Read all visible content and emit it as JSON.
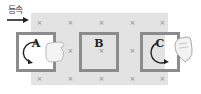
{
  "diagram": {
    "motion_label": "등속",
    "field_symbol": "×",
    "field_marks": [
      {
        "x": 36,
        "y": 20
      },
      {
        "x": 67,
        "y": 20
      },
      {
        "x": 98,
        "y": 20
      },
      {
        "x": 129,
        "y": 20
      },
      {
        "x": 159,
        "y": 20
      },
      {
        "x": 36,
        "y": 48
      },
      {
        "x": 67,
        "y": 48
      },
      {
        "x": 98,
        "y": 48
      },
      {
        "x": 129,
        "y": 48
      },
      {
        "x": 159,
        "y": 48
      },
      {
        "x": 36,
        "y": 76
      },
      {
        "x": 67,
        "y": 76
      },
      {
        "x": 98,
        "y": 76
      },
      {
        "x": 129,
        "y": 76
      },
      {
        "x": 159,
        "y": 76
      }
    ],
    "loops": [
      {
        "label": "A",
        "current_direction": "counterclockwise",
        "hand": true
      },
      {
        "label": "B",
        "current_direction": "none",
        "hand": false
      },
      {
        "label": "C",
        "current_direction": "clockwise",
        "hand": true
      }
    ],
    "colors": {
      "field": "#e3e3e3",
      "loop_border": "#8c8c8c",
      "field_mark": "#8a8a8a"
    }
  }
}
